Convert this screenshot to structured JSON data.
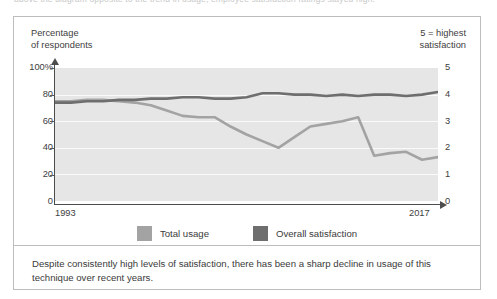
{
  "page": {
    "cut_off_top_line": "above the diagram opposite to the trend in usage, employee satisfaction ratings stayed high."
  },
  "figure": {
    "left_axis_title_line1": "Percentage",
    "left_axis_title_line2": "of respondents",
    "right_axis_title_line1": "5 = highest",
    "right_axis_title_line2": "satisfaction",
    "legend": [
      {
        "label": "Total usage",
        "color": "#a3a3a3",
        "name": "total-usage"
      },
      {
        "label": "Overall satisfaction",
        "color": "#6e6e6e",
        "name": "overall-satisfaction"
      }
    ],
    "caption": "Despite consistently high levels of satisfaction, there has been a sharp decline in usage of this technique over recent years."
  },
  "chart_data": {
    "type": "line",
    "title": "",
    "xlabel": "",
    "ylabel": "Percentage of respondents",
    "y2label": "5 = highest satisfaction",
    "x": [
      1993,
      1994,
      1995,
      1996,
      1997,
      1998,
      1999,
      2000,
      2001,
      2002,
      2003,
      2004,
      2005,
      2006,
      2007,
      2008,
      2009,
      2010,
      2011,
      2012,
      2013,
      2014,
      2015,
      2016,
      2017
    ],
    "xtick_labels": [
      "1993",
      "2017"
    ],
    "xlim": [
      1993,
      2017
    ],
    "ylim": [
      0,
      100
    ],
    "ytick_labels": [
      "100%",
      "80",
      "60",
      "40",
      "20",
      "0"
    ],
    "yticks": [
      100,
      80,
      60,
      40,
      20,
      0
    ],
    "y2lim": [
      0,
      5
    ],
    "y2tick_labels": [
      "5",
      "4",
      "3",
      "2",
      "1",
      "0"
    ],
    "y2ticks": [
      5,
      4,
      3,
      2,
      1,
      0
    ],
    "grid": true,
    "legend_position": "bottom",
    "series": [
      {
        "name": "Total usage",
        "axis": "left",
        "color": "#a3a3a3",
        "values": [
          75,
          75,
          76,
          76,
          75,
          74,
          72,
          68,
          64,
          63,
          63,
          56,
          50,
          45,
          40,
          48,
          56,
          58,
          60,
          63,
          34,
          36,
          37,
          31,
          33
        ]
      },
      {
        "name": "Overall satisfaction",
        "axis": "right",
        "color": "#6e6e6e",
        "values_percent": [
          74,
          74,
          75,
          75,
          76,
          76,
          77,
          77,
          78,
          78,
          77,
          77,
          78,
          81,
          81,
          80,
          80,
          79,
          80,
          79,
          80,
          80,
          79,
          80,
          82
        ],
        "values": [
          3.7,
          3.7,
          3.75,
          3.75,
          3.8,
          3.8,
          3.85,
          3.85,
          3.9,
          3.9,
          3.85,
          3.85,
          3.9,
          4.05,
          4.05,
          4.0,
          4.0,
          3.95,
          4.0,
          3.95,
          4.0,
          4.0,
          3.95,
          4.0,
          4.1
        ]
      }
    ]
  }
}
